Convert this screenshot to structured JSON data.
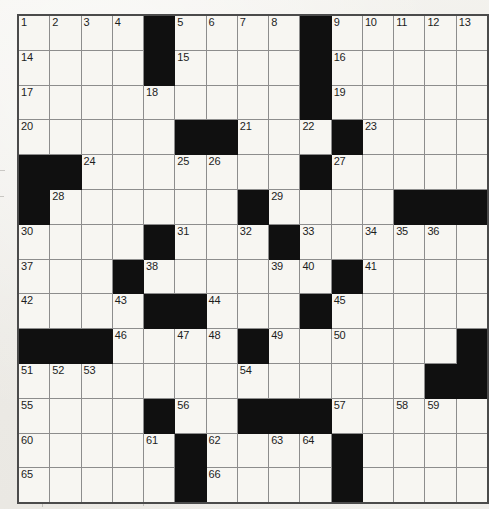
{
  "page": {
    "kind": "crossword-puzzle-grid",
    "paper_color": "#f2f1ed",
    "cell_color": "#f7f6f2",
    "block_color": "#101010",
    "grid_line_color": "#8d8d8d",
    "border_color": "#4b4b4b",
    "number_color": "#1d1d1d"
  },
  "grid": {
    "columns": 14,
    "rows": [
      ".....#....#...",
      ".....#....#...",
      ".....#........",
      ".....##.......",
      "##............",
      "#.....#....###",
      "....#....#....",
      "...#....#.#...",
      "...#.##....#..",
      "###...##..#..#",
      ".......#.....#",
      "....#.....#...",
      "....#.#...#...",
      "....#.#...#..."
    ],
    "cell_width_px": 32.5,
    "cell_height_px": 33.8,
    "origin_x_px": 17,
    "origin_y_px": 14,
    "legend": {
      "block": "#",
      "open": ".",
      "note": "rows array holds one string per row; numbers array holds [row, col, clue_number]"
    },
    "numbers": [
      [
        0,
        0,
        1
      ],
      [
        0,
        1,
        2
      ],
      [
        0,
        2,
        3
      ],
      [
        0,
        3,
        4
      ],
      [
        0,
        6,
        5
      ],
      [
        0,
        7,
        6
      ],
      [
        0,
        8,
        7
      ],
      [
        0,
        9,
        8
      ],
      [
        0,
        11,
        9
      ],
      [
        0,
        12,
        10
      ],
      [
        0,
        13,
        11
      ],
      [
        0,
        14,
        12
      ],
      [
        0,
        15,
        13
      ],
      [
        1,
        0,
        14
      ],
      [
        1,
        6,
        15
      ],
      [
        1,
        11,
        16
      ],
      [
        2,
        0,
        17
      ],
      [
        2,
        5,
        18
      ],
      [
        2,
        11,
        19
      ],
      [
        3,
        0,
        20
      ],
      [
        3,
        7,
        21
      ],
      [
        3,
        9,
        22
      ],
      [
        3,
        11,
        23
      ],
      [
        4,
        2,
        24
      ],
      [
        4,
        6,
        25
      ],
      [
        4,
        7,
        26
      ],
      [
        4,
        10,
        27
      ],
      [
        5,
        1,
        28
      ],
      [
        5,
        8,
        29
      ],
      [
        6,
        0,
        30
      ],
      [
        6,
        5,
        31
      ],
      [
        6,
        7,
        32
      ],
      [
        6,
        9,
        33
      ],
      [
        6,
        10,
        34
      ],
      [
        6,
        11,
        35
      ],
      [
        6,
        12,
        36
      ],
      [
        7,
        0,
        37
      ],
      [
        7,
        4,
        38
      ],
      [
        7,
        8,
        39
      ],
      [
        7,
        9,
        40
      ],
      [
        7,
        11,
        41
      ],
      [
        8,
        0,
        42
      ],
      [
        8,
        3,
        43
      ],
      [
        8,
        7,
        44
      ],
      [
        8,
        10,
        45
      ],
      [
        9,
        3,
        46
      ],
      [
        9,
        5,
        47
      ],
      [
        9,
        6,
        48
      ],
      [
        9,
        8,
        49
      ],
      [
        9,
        10,
        50
      ],
      [
        10,
        0,
        51
      ],
      [
        10,
        1,
        52
      ],
      [
        10,
        2,
        53
      ],
      [
        10,
        7,
        54
      ],
      [
        11,
        0,
        55
      ],
      [
        11,
        5,
        56
      ],
      [
        11,
        10,
        57
      ],
      [
        11,
        12,
        58
      ],
      [
        11,
        13,
        59
      ],
      [
        12,
        0,
        60
      ],
      [
        12,
        4,
        61
      ],
      [
        12,
        6,
        62
      ],
      [
        12,
        8,
        63
      ],
      [
        12,
        9,
        64
      ],
      [
        13,
        0,
        65
      ],
      [
        13,
        6,
        66
      ],
      [
        13,
        10,
        67
      ]
    ],
    "layout": [
      {
        "row": 0,
        "cells": [
          {
            "n": "1"
          },
          {
            "n": "2"
          },
          {
            "n": "3"
          },
          {
            "n": "4"
          },
          {
            "block": true
          },
          {
            "n": "5"
          },
          {
            "n": "6"
          },
          {
            "n": "7"
          },
          {
            "n": "8"
          },
          {
            "block": true
          },
          {
            "n": "9"
          },
          {
            "n": "10"
          },
          {
            "n": "11"
          },
          {
            "n": "12"
          },
          {
            "n": "13"
          }
        ]
      }
    ]
  },
  "grid_spec": {
    "cols": 15,
    "rows": 14,
    "blocks": [
      [
        0,
        4
      ],
      [
        0,
        9
      ],
      [
        1,
        4
      ],
      [
        1,
        9
      ],
      [
        2,
        9
      ],
      [
        3,
        5
      ],
      [
        3,
        6
      ],
      [
        3,
        10
      ],
      [
        4,
        0
      ],
      [
        4,
        1
      ],
      [
        4,
        9
      ],
      [
        5,
        0
      ],
      [
        5,
        7
      ],
      [
        5,
        12
      ],
      [
        5,
        13
      ],
      [
        5,
        14
      ],
      [
        6,
        4
      ],
      [
        6,
        8
      ],
      [
        7,
        3
      ],
      [
        7,
        10
      ],
      [
        8,
        4
      ],
      [
        8,
        5
      ],
      [
        8,
        9
      ],
      [
        9,
        0
      ],
      [
        9,
        1
      ],
      [
        9,
        2
      ],
      [
        9,
        7
      ],
      [
        9,
        14
      ],
      [
        10,
        13
      ],
      [
        10,
        14
      ],
      [
        11,
        4
      ],
      [
        11,
        7
      ],
      [
        11,
        8
      ],
      [
        11,
        9
      ],
      [
        12,
        5
      ],
      [
        12,
        10
      ],
      [
        13,
        5
      ],
      [
        13,
        10
      ]
    ],
    "numbered": {
      "0": {
        "0": "1",
        "1": "2",
        "2": "3",
        "3": "4",
        "5": "5",
        "6": "6",
        "7": "7",
        "8": "8",
        "10": "9",
        "11": "10",
        "12": "11",
        "13": "12",
        "14": "13"
      },
      "1": {
        "0": "14",
        "5": "15",
        "10": "16"
      },
      "2": {
        "0": "17",
        "4": "18",
        "10": "19"
      },
      "3": {
        "0": "20",
        "7": "21",
        "9": "22",
        "11": "23"
      },
      "4": {
        "2": "24",
        "5": "25",
        "6": "26",
        "10": "27"
      },
      "5": {
        "1": "28",
        "8": "29"
      },
      "6": {
        "0": "30",
        "5": "31",
        "7": "32",
        "9": "33",
        "11": "34",
        "12": "35",
        "13": "36"
      },
      "7": {
        "0": "37",
        "4": "38",
        "8": "39",
        "9": "40",
        "11": "41"
      },
      "8": {
        "0": "42",
        "3": "43",
        "6": "44",
        "10": "45"
      },
      "9": {
        "3": "46",
        "5": "47",
        "6": "48",
        "8": "49",
        "10": "50"
      },
      "10": {
        "0": "51",
        "1": "52",
        "2": "53",
        "7": "54"
      },
      "11": {
        "0": "55",
        "5": "56",
        "10": "57",
        "12": "58",
        "13": "59"
      },
      "12": {
        "0": "60",
        "4": "61",
        "6": "62",
        "8": "63",
        "9": "64"
      },
      "13": {
        "0": "65",
        "6": "66",
        "10": "67"
      }
    }
  },
  "grid_final": {
    "cols": 14,
    "rows": 14,
    "pattern": [
      "....#....#.....",
      "....#....#.....",
      "....#.....#....",
      "....##........."
    ]
  }
}
